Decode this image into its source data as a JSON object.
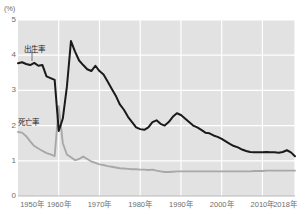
{
  "chart_data": {
    "type": "line",
    "title": "",
    "xlabel": "",
    "ylabel": "",
    "unit_label": "(%)",
    "ylim": [
      0,
      5
    ],
    "xlim": [
      1950,
      2018
    ],
    "grid": true,
    "legend_position": "inline-annotation",
    "yticks": [
      "5",
      "4",
      "3",
      "2",
      "1",
      "0"
    ],
    "ytick_values": [
      5,
      4,
      3,
      2,
      1,
      0
    ],
    "xticks": [
      "1950年",
      "1960年",
      "1970年",
      "1980年",
      "1990年",
      "2000年",
      "2010年",
      "2018年"
    ],
    "xtick_values": [
      1950,
      1960,
      1970,
      1980,
      1990,
      2000,
      2010,
      2018
    ],
    "colors": {
      "birth_rate": "#1a1a1a",
      "death_rate": "#a8a8a8",
      "plot_background": "#e2e2e2",
      "gridline": "#ffffff",
      "axis_text": "#6d6d6d"
    },
    "x": [
      1950,
      1951,
      1952,
      1953,
      1954,
      1955,
      1956,
      1957,
      1958,
      1959,
      1960,
      1961,
      1962,
      1963,
      1964,
      1965,
      1966,
      1967,
      1968,
      1969,
      1970,
      1971,
      1972,
      1973,
      1974,
      1975,
      1976,
      1977,
      1978,
      1979,
      1980,
      1981,
      1982,
      1983,
      1984,
      1985,
      1986,
      1987,
      1988,
      1989,
      1990,
      1991,
      1992,
      1993,
      1994,
      1995,
      1996,
      1997,
      1998,
      1999,
      2000,
      2001,
      2002,
      2003,
      2004,
      2005,
      2006,
      2007,
      2008,
      2009,
      2010,
      2011,
      2012,
      2013,
      2014,
      2015,
      2016,
      2017,
      2018
    ],
    "series": [
      {
        "name": "出生率",
        "label": "出生率",
        "color": "#1a1a1a",
        "values": [
          3.77,
          3.8,
          3.75,
          3.72,
          3.78,
          3.7,
          3.72,
          3.4,
          3.35,
          3.3,
          1.85,
          2.2,
          3.1,
          4.4,
          4.1,
          3.85,
          3.72,
          3.6,
          3.55,
          3.7,
          3.55,
          3.45,
          3.25,
          3.05,
          2.85,
          2.6,
          2.45,
          2.25,
          2.1,
          1.95,
          1.9,
          1.88,
          1.95,
          2.1,
          2.15,
          2.05,
          2.0,
          2.1,
          2.25,
          2.35,
          2.3,
          2.2,
          2.1,
          2.0,
          1.95,
          1.88,
          1.8,
          1.78,
          1.72,
          1.68,
          1.62,
          1.55,
          1.48,
          1.42,
          1.38,
          1.32,
          1.28,
          1.25,
          1.24,
          1.24,
          1.24,
          1.25,
          1.24,
          1.24,
          1.23,
          1.25,
          1.3,
          1.24,
          1.13
        ]
      },
      {
        "name": "死亡率",
        "label": "死亡率",
        "color": "#a8a8a8",
        "values": [
          1.82,
          1.8,
          1.7,
          1.55,
          1.42,
          1.35,
          1.28,
          1.22,
          1.18,
          1.13,
          2.55,
          1.5,
          1.18,
          1.1,
          1.02,
          1.05,
          1.12,
          1.05,
          0.98,
          0.94,
          0.9,
          0.88,
          0.85,
          0.83,
          0.81,
          0.79,
          0.78,
          0.77,
          0.76,
          0.76,
          0.75,
          0.75,
          0.74,
          0.75,
          0.72,
          0.7,
          0.68,
          0.68,
          0.69,
          0.7,
          0.7,
          0.7,
          0.7,
          0.7,
          0.7,
          0.7,
          0.7,
          0.7,
          0.7,
          0.7,
          0.7,
          0.7,
          0.7,
          0.7,
          0.7,
          0.7,
          0.7,
          0.7,
          0.71,
          0.71,
          0.71,
          0.72,
          0.72,
          0.72,
          0.72,
          0.72,
          0.72,
          0.72,
          0.72
        ]
      }
    ],
    "annotations": [
      {
        "text": "出生率",
        "x_px": 24,
        "y_px": 43
      },
      {
        "text": "死亡率",
        "x_px": 18,
        "y_px": 116
      }
    ]
  }
}
